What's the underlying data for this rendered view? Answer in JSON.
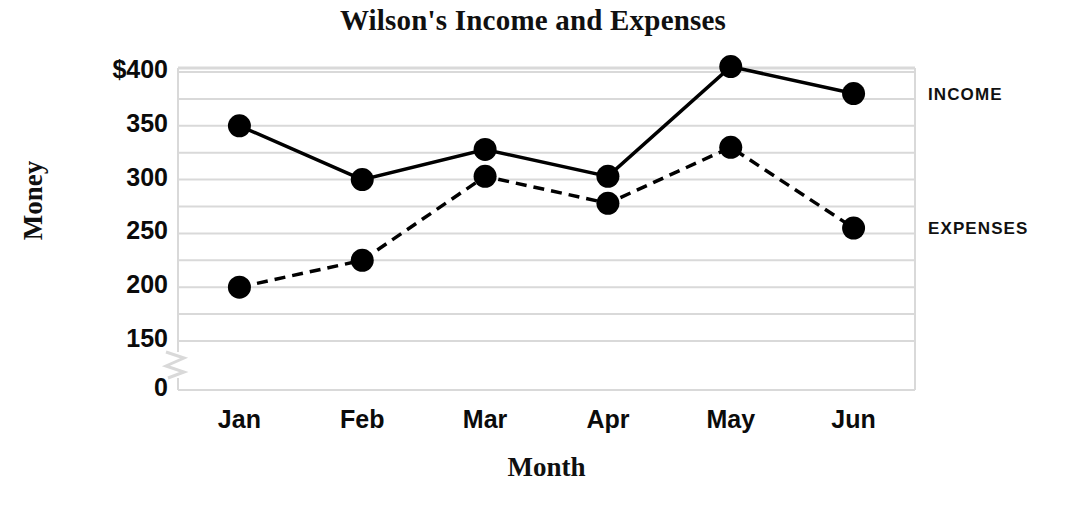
{
  "chart_data": {
    "type": "line",
    "title": "Wilson's Income and Expenses",
    "xlabel": "Month",
    "ylabel": "Money",
    "categories": [
      "Jan",
      "Feb",
      "Mar",
      "Apr",
      "May",
      "Jun"
    ],
    "series": [
      {
        "name": "INCOME",
        "style": "solid",
        "values": [
          350,
          300,
          328,
          303,
          405,
          380
        ]
      },
      {
        "name": "EXPENSES",
        "style": "dashed",
        "values": [
          200,
          225,
          303,
          278,
          330,
          255
        ]
      }
    ],
    "ylim": [
      0,
      412
    ],
    "y_tick_labels": [
      "$400",
      "350",
      "300",
      "250",
      "200",
      "150",
      "0"
    ],
    "y_tick_values": [
      400,
      350,
      300,
      250,
      200,
      150,
      0
    ],
    "y_minor_gridlines": [
      375,
      325,
      275,
      225,
      175
    ],
    "axis_break": true,
    "axis_break_between": [
      0,
      150
    ],
    "grid": true,
    "grid_color": "#d9d9d9",
    "legend_position": "right-inline",
    "marker": "filled-circle",
    "marker_color": "#000000",
    "line_color": "#000000",
    "background": "#ffffff"
  },
  "labels": {
    "income": "INCOME",
    "expenses": "EXPENSES"
  }
}
